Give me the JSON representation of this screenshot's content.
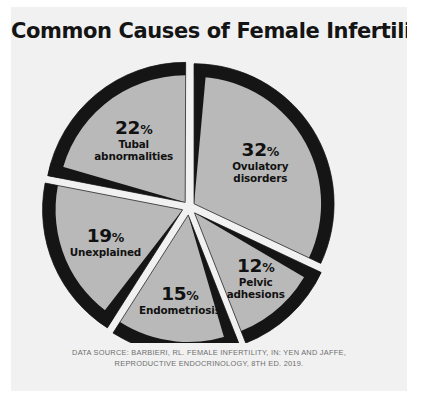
{
  "title": "Common Causes of Female Infertility",
  "colors": {
    "background": "#ffffff",
    "card": "#f1f1f1",
    "slice_fill": "#b9b9b9",
    "slice_edge": "#151515",
    "title_text": "#141414",
    "label_text": "#111111",
    "source_text": "#6e6e6e"
  },
  "source": {
    "line1": "DATA SOURCE: BARBIERI, RL. FEMALE INFERTILITY, IN: YEN AND JAFFE,",
    "line2": "REPRODUCTIVE ENDOCRINOLOGY, 8TH ED. 2019."
  },
  "chart_data": {
    "type": "pie",
    "title": "Common Causes of Female Infertility",
    "xlabel": "",
    "ylabel": "",
    "legend_position": "none",
    "grid": false,
    "exploded": true,
    "value_unit": "%",
    "total": 100,
    "categories": [
      "Ovulatory disorders",
      "Tubal abnormalities",
      "Unexplained",
      "Endometriosis",
      "Pelvic adhesions"
    ],
    "values": [
      32,
      22,
      19,
      15,
      12
    ],
    "slices": [
      {
        "label": "Ovulatory disorders",
        "label_line1": "Ovulatory",
        "label_line2": "disorders",
        "value": 32,
        "percent_text": "32",
        "percent_sign": "%",
        "start_angle": 0,
        "end_angle": 115.2,
        "explode": 6,
        "label_r": 0.56
      },
      {
        "label": "Tubal abnormalities",
        "label_line1": "Tubal",
        "label_line2": "abnormalities",
        "value": 22,
        "percent_text": "22",
        "percent_sign": "%",
        "start_angle": 281.0,
        "end_angle": 360.2,
        "explode": 6,
        "label_r": 0.58
      },
      {
        "label": "Unexplained",
        "label_line1": "Unexplained",
        "label_line2": "",
        "value": 19,
        "percent_text": "19",
        "percent_sign": "%",
        "start_angle": 212.5,
        "end_angle": 281.0,
        "explode": 7,
        "label_r": 0.6
      },
      {
        "label": "Endometriosis",
        "label_line1": "Endometriosis",
        "label_line2": "",
        "value": 15,
        "percent_text": "15",
        "percent_sign": "%",
        "start_angle": 158.5,
        "end_angle": 212.5,
        "explode": 8,
        "label_r": 0.62
      },
      {
        "label": "Pelvic adhesions",
        "label_line1": "Pelvic",
        "label_line2": "adhesions",
        "value": 12,
        "percent_text": "12",
        "percent_sign": "%",
        "start_angle": 115.2,
        "end_angle": 158.5,
        "explode": 8,
        "label_r": 0.64
      }
    ],
    "geometry": {
      "cx": 178,
      "cy": 152,
      "radius": 140,
      "edge_width": 13
    }
  }
}
